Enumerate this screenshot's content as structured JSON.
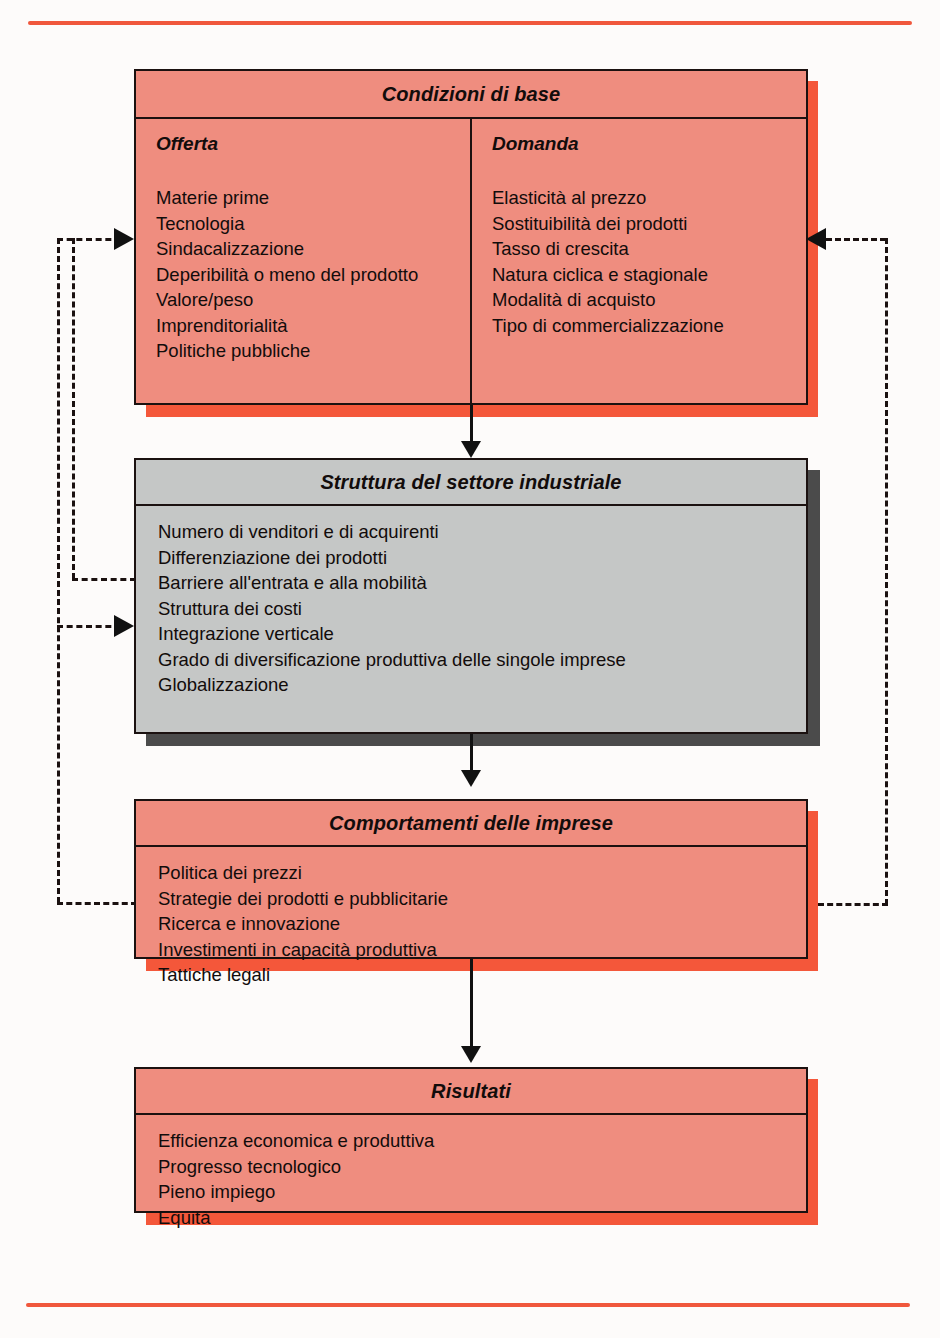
{
  "figure": {
    "top_rule_color": "#f0573c",
    "bottom_rule_color": "#f0573c",
    "pink_fill": "#ef8d7f",
    "gray_fill": "#c5c7c6",
    "pink_shadow": "#f4573a",
    "gray_shadow": "#4b4b4b"
  },
  "boxes": {
    "base_conditions": {
      "title": "Condizioni di base",
      "columns": [
        {
          "heading": "Offerta",
          "items": [
            "Materie prime",
            "Tecnologia",
            "Sindacalizzazione",
            "Deperibilità o meno del prodotto",
            "Valore/peso",
            "Imprenditorialità",
            "Politiche pubbliche"
          ]
        },
        {
          "heading": "Domanda",
          "items": [
            "Elasticità al prezzo",
            "Sostituibilità dei prodotti",
            "Tasso di crescita",
            "Natura ciclica e stagionale",
            "Modalità di acquisto",
            "Tipo di commercializzazione"
          ]
        }
      ]
    },
    "structure": {
      "title": "Struttura del settore industriale",
      "items": [
        "Numero di venditori e di acquirenti",
        "Differenziazione dei prodotti",
        "Barriere all'entrata e alla mobilità",
        "Struttura dei costi",
        "Integrazione verticale",
        "Grado di diversificazione produttiva delle singole imprese",
        "Globalizzazione"
      ]
    },
    "conduct": {
      "title": "Comportamenti delle imprese",
      "items": [
        "Politica dei prezzi",
        "Strategie dei prodotti e pubblicitarie",
        "Ricerca e innovazione",
        "Investimenti in capacità produttiva",
        "Tattiche legali"
      ]
    },
    "performance": {
      "title": "Risultati",
      "items": [
        "Efficienza economica e produttiva",
        "Progresso tecnologico",
        "Pieno impiego",
        "Equità"
      ]
    }
  },
  "connectors": {
    "flow_1_label": "Condizioni di base → Struttura del settore industriale",
    "flow_2_label": "Struttura del settore industriale → Comportamenti delle imprese",
    "flow_3_label": "Comportamenti delle imprese → Risultati",
    "feedback_left_outer_label": "Comportamenti delle imprese → Condizioni di base",
    "feedback_left_inner_label": "Struttura del settore industriale → Condizioni di base",
    "feedback_left_arrow_2_label": "Comportamenti delle imprese → Struttura del settore industriale",
    "feedback_right_label": "Comportamenti delle imprese → Condizioni di base"
  }
}
